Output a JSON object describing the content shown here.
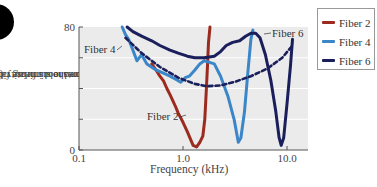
{
  "chart_data": {
    "type": "line",
    "title": "",
    "xlabel": "Frequency (kHz)",
    "ylabel": "Threshold intensity (relative dB) required to stimulate fiber above spontaneous firing rate",
    "ylabel_lines": [
      "Threshold intensity (relative dB)",
      "required to stimulate fiber above",
      "spontaneous firing rate"
    ],
    "x_scale": "log",
    "xlim": [
      0.1,
      13.0
    ],
    "ylim": [
      0,
      80
    ],
    "x_ticks": [
      0.1,
      1.0,
      10.0
    ],
    "x_tick_labels": [
      "0.1",
      "1.0",
      "10.0"
    ],
    "y_ticks": [
      0,
      20,
      40,
      60,
      80
    ],
    "y_tick_labels": [
      "0",
      "",
      "",
      "",
      "80"
    ],
    "grid": true,
    "legend_position": "right",
    "series": [
      {
        "name": "Fiber 2",
        "color": "#9b2a1f",
        "style": "solid",
        "points": [
          [
            0.5,
            56
          ],
          [
            0.55,
            52
          ],
          [
            0.6,
            48
          ],
          [
            0.65,
            45
          ],
          [
            0.7,
            40
          ],
          [
            0.75,
            36
          ],
          [
            0.8,
            32
          ],
          [
            0.85,
            28
          ],
          [
            0.9,
            24
          ],
          [
            1.0,
            18
          ],
          [
            1.1,
            12
          ],
          [
            1.2,
            6
          ],
          [
            1.25,
            3
          ],
          [
            1.35,
            2
          ],
          [
            1.45,
            5
          ],
          [
            1.55,
            9
          ],
          [
            1.62,
            20
          ],
          [
            1.68,
            40
          ],
          [
            1.72,
            55
          ],
          [
            1.76,
            70
          ],
          [
            1.82,
            80
          ]
        ]
      },
      {
        "name": "Fiber 4",
        "color": "#3a86c8",
        "style": "solid",
        "points": [
          [
            0.26,
            80
          ],
          [
            0.28,
            75
          ],
          [
            0.3,
            72
          ],
          [
            0.33,
            65
          ],
          [
            0.36,
            58
          ],
          [
            0.4,
            62
          ],
          [
            0.45,
            56
          ],
          [
            0.55,
            52
          ],
          [
            0.65,
            50
          ],
          [
            0.75,
            48
          ],
          [
            0.85,
            46
          ],
          [
            0.95,
            44
          ],
          [
            1.05,
            47
          ],
          [
            1.15,
            48
          ],
          [
            1.3,
            52
          ],
          [
            1.45,
            56
          ],
          [
            1.6,
            58
          ],
          [
            1.8,
            57
          ],
          [
            2.0,
            56
          ],
          [
            2.3,
            48
          ],
          [
            2.7,
            35
          ],
          [
            3.1,
            20
          ],
          [
            3.4,
            5
          ],
          [
            3.6,
            8
          ],
          [
            3.9,
            25
          ],
          [
            4.2,
            50
          ],
          [
            4.5,
            72
          ],
          [
            4.7,
            78
          ]
        ]
      },
      {
        "name": "Fiber 6",
        "color": "#1a1f5c",
        "style": "solid",
        "points": [
          [
            0.29,
            80
          ],
          [
            0.33,
            77
          ],
          [
            0.4,
            74
          ],
          [
            0.5,
            71
          ],
          [
            0.6,
            68
          ],
          [
            0.75,
            65
          ],
          [
            0.9,
            63
          ],
          [
            1.1,
            61
          ],
          [
            1.3,
            60
          ],
          [
            1.6,
            60
          ],
          [
            2.0,
            61
          ],
          [
            2.3,
            64
          ],
          [
            2.6,
            68
          ],
          [
            3.0,
            70
          ],
          [
            3.5,
            71
          ],
          [
            4.0,
            74
          ],
          [
            4.5,
            76
          ],
          [
            5.0,
            76
          ],
          [
            5.5,
            73
          ],
          [
            6.2,
            62
          ],
          [
            7.0,
            45
          ],
          [
            7.8,
            25
          ],
          [
            8.4,
            8
          ],
          [
            8.8,
            3
          ],
          [
            9.3,
            8
          ],
          [
            10.0,
            30
          ],
          [
            10.8,
            55
          ],
          [
            11.3,
            72
          ]
        ]
      },
      {
        "name": "Optimal threshold envelope",
        "color": "#1a1f5c",
        "style": "dashed",
        "points": [
          [
            0.28,
            73
          ],
          [
            0.4,
            63
          ],
          [
            0.6,
            54
          ],
          [
            0.9,
            47
          ],
          [
            1.3,
            43
          ],
          [
            1.7,
            41.5
          ],
          [
            2.3,
            42
          ],
          [
            3.2,
            44.5
          ],
          [
            4.5,
            48
          ],
          [
            6.5,
            53
          ],
          [
            9.0,
            60
          ],
          [
            11.3,
            68
          ]
        ]
      }
    ],
    "annotations": [
      {
        "text": "Fiber 4",
        "freq": 0.165,
        "db": 63
      },
      {
        "text": "Fiber 2",
        "freq": 0.55,
        "db": 27
      },
      {
        "text": "Fiber 6",
        "freq": 7.1,
        "db": 77
      }
    ]
  },
  "legend": {
    "items": [
      {
        "label": "Fiber 2",
        "color": "#9b2a1f"
      },
      {
        "label": "Fiber 4",
        "color": "#3a86c8"
      },
      {
        "label": "Fiber 6",
        "color": "#1a1f5c"
      }
    ]
  },
  "axis": {
    "x_title": "Frequency (kHz)",
    "y_top_label": "80",
    "y_bottom_label": "0",
    "x_labels": [
      "0.1",
      "1.0",
      "10.0"
    ]
  },
  "annotations": {
    "fiber4": "Fiber 4",
    "fiber2": "Fiber 2",
    "fiber6": "Fiber 6"
  },
  "colors": {
    "plot_bg": "#ebebeb",
    "grid": "#ffffff"
  }
}
